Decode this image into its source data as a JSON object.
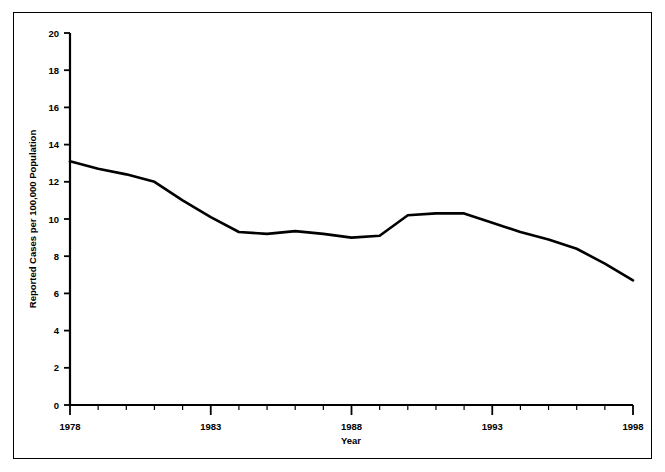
{
  "chart_data": {
    "type": "line",
    "title": "",
    "subtitle": "",
    "xlabel": "Year",
    "ylabel": "Reported Cases per 100,000 Population",
    "xlim": [
      1978,
      1998
    ],
    "ylim": [
      0,
      20
    ],
    "grid": false,
    "legend": null,
    "x_tick_labels": [
      "1978",
      "1983",
      "1988",
      "1993",
      "1998"
    ],
    "x_tick_values": [
      1978,
      1983,
      1988,
      1993,
      1998
    ],
    "x_minor_tick_step": 1,
    "y_tick_labels": [
      "0",
      "2",
      "4",
      "6",
      "8",
      "10",
      "12",
      "14",
      "16",
      "18",
      "20"
    ],
    "y_tick_values": [
      0,
      2,
      4,
      6,
      8,
      10,
      12,
      14,
      16,
      18,
      20
    ],
    "series": [
      {
        "name": "Reported Cases per 100,000 Population",
        "color": "#000000",
        "x": [
          1978,
          1979,
          1980,
          1981,
          1982,
          1983,
          1984,
          1985,
          1986,
          1987,
          1988,
          1989,
          1990,
          1991,
          1992,
          1993,
          1994,
          1995,
          1996,
          1997,
          1998
        ],
        "values": [
          13.1,
          12.7,
          12.4,
          12.0,
          11.0,
          10.1,
          9.3,
          9.2,
          9.35,
          9.2,
          9.0,
          9.1,
          10.2,
          10.3,
          10.3,
          9.8,
          9.3,
          8.9,
          8.4,
          7.6,
          6.7
        ]
      }
    ]
  },
  "axes": {
    "y_axis_title": "Reported Cases per 100,000 Population",
    "x_axis_title": "Year"
  },
  "colors": {
    "line": "#000000",
    "axis": "#000000",
    "background": "#ffffff",
    "border": "#000000"
  }
}
